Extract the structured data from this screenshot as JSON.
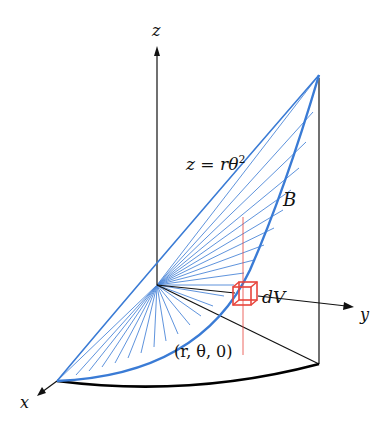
{
  "diagram": {
    "type": "3d-solid-region",
    "axes": {
      "x_label": "x",
      "y_label": "y",
      "z_label": "z"
    },
    "surface_label": "z = rθ²",
    "surface_label_parts": {
      "lhs": "z = r",
      "theta": "θ",
      "exp": "2"
    },
    "region_label": "B",
    "volume_element_label": "dV",
    "point_label": "(r, θ, 0)",
    "colors": {
      "surface": "#3a7bd5",
      "volume_element": "#e8453c",
      "axes": "#111111",
      "base_arc": "#000000"
    }
  }
}
